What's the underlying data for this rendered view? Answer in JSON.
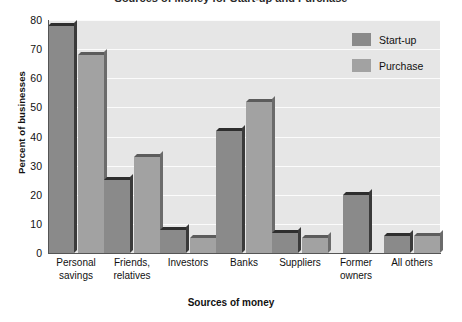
{
  "title_sliver": "Sources of Money for Start-up and Purchase",
  "chart_data": {
    "type": "bar",
    "title": "Sources of Money for Start-up and Purchase",
    "xlabel": "Sources of money",
    "ylabel": "Percent of businesses",
    "ylim": [
      0,
      80
    ],
    "yticks": [
      0,
      10,
      20,
      30,
      40,
      50,
      60,
      70,
      80
    ],
    "grid": true,
    "legend_position": "top-right",
    "categories": [
      "Personal savings",
      "Friends, relatives",
      "Investors",
      "Banks",
      "Suppliers",
      "Former owners",
      "All others"
    ],
    "category_lines": [
      [
        "Personal",
        "savings"
      ],
      [
        "Friends,",
        "relatives"
      ],
      [
        "Investors",
        ""
      ],
      [
        "Banks",
        ""
      ],
      [
        "Suppliers",
        ""
      ],
      [
        "Former",
        "owners"
      ],
      [
        "All others",
        ""
      ]
    ],
    "series": [
      {
        "name": "Start-up",
        "color": "#8a8a8a",
        "values": [
          78,
          25,
          8,
          42,
          7,
          20,
          6
        ]
      },
      {
        "name": "Purchase",
        "color": "#a2a2a2",
        "values": [
          68,
          33,
          5,
          52,
          5,
          null,
          6
        ]
      }
    ]
  },
  "legend": {
    "items": [
      {
        "label": "Start-up",
        "color": "#8a8a8a"
      },
      {
        "label": "Purchase",
        "color": "#a2a2a2"
      }
    ]
  },
  "colors": {
    "plot_background": "#e6e6e6",
    "gridline": "#fbfbfb",
    "axis": "#555555",
    "startup_bar": "#8a8a8a",
    "purchase_bar": "#a2a2a2",
    "bar_shadow": "#2e2e2e"
  }
}
